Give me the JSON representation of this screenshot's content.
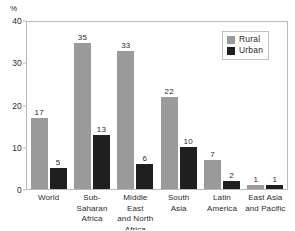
{
  "chart_data": {
    "type": "bar",
    "title": "",
    "subtitle": "",
    "xlabel": "",
    "ylabel": "%",
    "ylim": [
      0,
      40
    ],
    "yticks": [
      "0",
      "10",
      "20",
      "30",
      "40"
    ],
    "grid": false,
    "legend_position": "top-right",
    "categories": [
      "World",
      "Sub-Saharan Africa",
      "Middle East and North Africa",
      "South Asia",
      "Latin America",
      "East Asia and Pacific"
    ],
    "category_lines": [
      [
        "World"
      ],
      [
        "Sub-",
        "Saharan",
        "Africa"
      ],
      [
        "Middle East",
        "and North",
        "Africa"
      ],
      [
        "South",
        "Asia"
      ],
      [
        "Latin",
        "America"
      ],
      [
        "East Asia",
        "and Pacific"
      ]
    ],
    "series": [
      {
        "name": "Rural",
        "color": "#9a9a9a",
        "values": [
          17,
          35,
          33,
          22,
          7,
          1
        ]
      },
      {
        "name": "Urban",
        "color": "#1f1f1f",
        "values": [
          5,
          13,
          6,
          10,
          2,
          1
        ]
      }
    ]
  },
  "axis": {
    "unit_label": "%"
  },
  "legend": {
    "items": [
      {
        "label": "Rural",
        "color": "#9a9a9a"
      },
      {
        "label": "Urban",
        "color": "#1f1f1f"
      }
    ]
  }
}
